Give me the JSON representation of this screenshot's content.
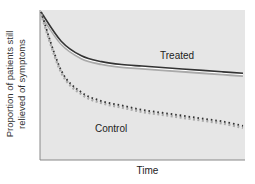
{
  "chart_data": {
    "type": "line",
    "title": "",
    "xlabel": "Time",
    "ylabel": "Proportion of patients still relieved of symptoms",
    "ylabel_lines": [
      "Proportion of patients still",
      "relieved of symptoms"
    ],
    "x_ticks": [],
    "y_ticks": [],
    "grid": false,
    "legend": "inline labels",
    "x": [
      0,
      0.1,
      0.2,
      0.3,
      0.4,
      0.5,
      0.6,
      0.7,
      0.8,
      0.9,
      1.0
    ],
    "series": [
      {
        "name": "Treated",
        "style": "solid dark with light shadow",
        "values": [
          1.0,
          0.8,
          0.7,
          0.66,
          0.64,
          0.63,
          0.62,
          0.61,
          0.6,
          0.59,
          0.58
        ]
      },
      {
        "name": "Control",
        "style": "dotted",
        "values": [
          1.0,
          0.6,
          0.45,
          0.39,
          0.36,
          0.33,
          0.31,
          0.29,
          0.27,
          0.25,
          0.22
        ]
      }
    ],
    "annotations": [
      {
        "text": "Treated",
        "near_series": "Treated"
      },
      {
        "text": "Control",
        "near_series": "Control"
      }
    ]
  },
  "labels": {
    "treated": "Treated",
    "control": "Control"
  }
}
